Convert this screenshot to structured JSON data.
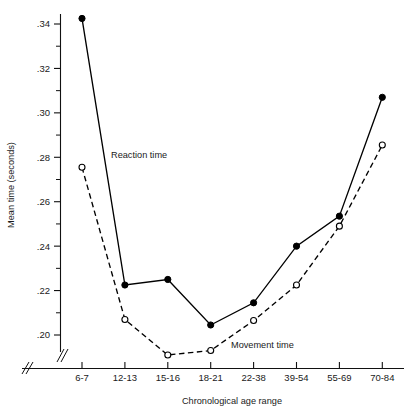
{
  "chart_data": {
    "type": "line",
    "title": "",
    "xlabel": "Chronological age range",
    "ylabel": "Mean time (seconds)",
    "categories": [
      "6-7",
      "12-13",
      "15-16",
      "18-21",
      "22-38",
      "39-54",
      "55-69",
      "70-84"
    ],
    "ylim": [
      0.185,
      0.348
    ],
    "ytick_labels": [
      ".34",
      ".32",
      ".30",
      ".28",
      ".26",
      ".24",
      ".22",
      ".20"
    ],
    "ytick_values": [
      0.34,
      0.32,
      0.3,
      0.28,
      0.26,
      0.24,
      0.22,
      0.2
    ],
    "yminor_values": [
      0.33,
      0.31,
      0.29,
      0.27,
      0.25,
      0.23,
      0.21
    ],
    "grid": false,
    "legend_position": "inline-annotation",
    "axis_break": "y-axis-break-below-.20",
    "series": [
      {
        "name": "Reaction time",
        "marker": "filled-circle",
        "linestyle": "solid",
        "color": "#000000",
        "values": [
          0.3425,
          0.2225,
          0.225,
          0.2045,
          0.2145,
          0.24,
          0.2535,
          0.307
        ],
        "annotation": "Reaction time"
      },
      {
        "name": "Movement time",
        "marker": "open-circle",
        "linestyle": "dashed",
        "color": "#000000",
        "values": [
          0.2755,
          0.207,
          0.191,
          0.193,
          0.2065,
          0.2225,
          0.249,
          0.2855
        ],
        "annotation": "Movement time"
      }
    ]
  },
  "annotations": {
    "reaction_time_label": "Reaction time",
    "movement_time_label": "Movement time"
  }
}
